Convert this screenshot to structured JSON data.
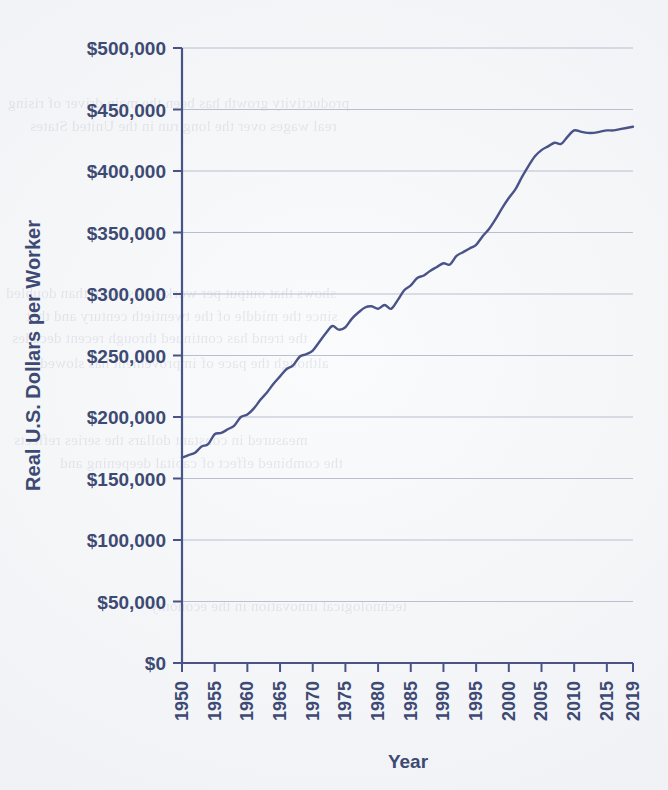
{
  "page": {
    "background_color": "#f2f3f6",
    "bleed_through_lines": [
      "productivity growth has been the main driver of rising",
      "real wages over the long run in the United States",
      "shows that output per worker has more than doubled",
      "since the middle of the twentieth century and that",
      "the trend has continued through recent decades",
      "although the pace of improvement has slowed",
      "measured in constant dollars the series reflects",
      "the combined effect of capital deepening and",
      "technological innovation in the economy"
    ]
  },
  "chart_data": {
    "type": "line",
    "title": "",
    "xlabel": "Year",
    "ylabel": "Real U.S. Dollars per Worker",
    "xlim": [
      1950,
      2019
    ],
    "ylim": [
      0,
      500000
    ],
    "grid": true,
    "legend": "none",
    "line_color": "#4a5388",
    "line_width": 2.4,
    "y_ticks": [
      0,
      50000,
      100000,
      150000,
      200000,
      250000,
      300000,
      350000,
      400000,
      450000,
      500000
    ],
    "y_tick_labels": [
      "$0",
      "$50,000",
      "$100,000",
      "$150,000",
      "$200,000",
      "$250,000",
      "$300,000",
      "$350,000",
      "$400,000",
      "$450,000",
      "$500,000"
    ],
    "x_ticks": [
      1950,
      1955,
      1960,
      1965,
      1970,
      1975,
      1980,
      1985,
      1990,
      1995,
      2000,
      2005,
      2010,
      2015,
      2019
    ],
    "x_tick_labels": [
      "1950",
      "1955",
      "1960",
      "1965",
      "1970",
      "1975",
      "1980",
      "1985",
      "1990",
      "1995",
      "2000",
      "2005",
      "2010",
      "2015",
      "2019"
    ],
    "x": [
      1950,
      1951,
      1952,
      1953,
      1954,
      1955,
      1956,
      1957,
      1958,
      1959,
      1960,
      1961,
      1962,
      1963,
      1964,
      1965,
      1966,
      1967,
      1968,
      1969,
      1970,
      1971,
      1972,
      1973,
      1974,
      1975,
      1976,
      1977,
      1978,
      1979,
      1980,
      1981,
      1982,
      1983,
      1984,
      1985,
      1986,
      1987,
      1988,
      1989,
      1990,
      1991,
      1992,
      1993,
      1994,
      1995,
      1996,
      1997,
      1998,
      1999,
      2000,
      2001,
      2002,
      2003,
      2004,
      2005,
      2006,
      2007,
      2008,
      2009,
      2010,
      2011,
      2012,
      2013,
      2014,
      2015,
      2016,
      2017,
      2018,
      2019
    ],
    "values": [
      167000,
      169000,
      171000,
      176000,
      178000,
      186000,
      187000,
      190000,
      193000,
      200000,
      202000,
      207000,
      214000,
      220000,
      227000,
      233000,
      239000,
      242000,
      249000,
      251000,
      254000,
      261000,
      268000,
      274000,
      271000,
      273000,
      280000,
      285000,
      289000,
      290000,
      288000,
      291000,
      288000,
      295000,
      303000,
      307000,
      313000,
      315000,
      319000,
      322000,
      325000,
      324000,
      331000,
      334000,
      337000,
      340000,
      347000,
      353000,
      361000,
      370000,
      378000,
      385000,
      395000,
      404000,
      412000,
      417000,
      420000,
      423000,
      422000,
      428000,
      433000,
      432000,
      431000,
      431000,
      432000,
      433000,
      433000,
      434000,
      435000,
      436000
    ]
  }
}
